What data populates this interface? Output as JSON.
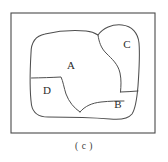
{
  "figure": {
    "caption": "( c )",
    "frame": {
      "x": 11,
      "y": 13,
      "width": 144,
      "height": 120,
      "stroke_color": "#4a4a4a"
    },
    "background_color": "#ffffff",
    "outline_color": "#4f4f4f",
    "label_color": "#2b2b2b",
    "regions": [
      {
        "id": "A",
        "label": "A",
        "x": 71,
        "y": 69
      },
      {
        "id": "B",
        "label": "B",
        "x": 118,
        "y": 108
      },
      {
        "id": "C",
        "label": "C",
        "x": 127,
        "y": 48
      },
      {
        "id": "D",
        "label": "D",
        "x": 47,
        "y": 94
      }
    ],
    "shapes": {
      "blob_outline": "M 31 53 C 31 42, 35 36, 45 34 C 58 31, 74 30, 86 31 C 92 31.5, 95 33, 98 35 C 103 28, 112 24, 122 25 C 132 26, 138 33, 139 43 C 140 55, 139 72, 138 86 C 137 98, 136 108, 132 114 C 128 119, 120 120, 110 119 C 92 117.5, 66 117, 48 117 C 39 117, 33 113, 31.5 105 C 30 94, 30 70, 31 53 Z",
      "divider_A_C": "M 98 35 C 99 42, 101 48, 106 53 C 112 59, 118 64, 120 73 C 121.5 80, 121 86, 120.5 92",
      "divider_C_B": "M 120.5 92 C 126 91.8, 132 91.5, 138 91",
      "divider_A_D": "M 31.5 78 C 41 77.8, 52 77.5, 61 77 C 63 81, 64 88, 66 94 C 69 102, 74 108, 80 112",
      "divider_A_B": "M 80 112 C 85 106, 92 103, 101 102 C 110 101, 118 101, 124 101"
    },
    "caption_position": {
      "x": 84,
      "y": 149
    }
  }
}
